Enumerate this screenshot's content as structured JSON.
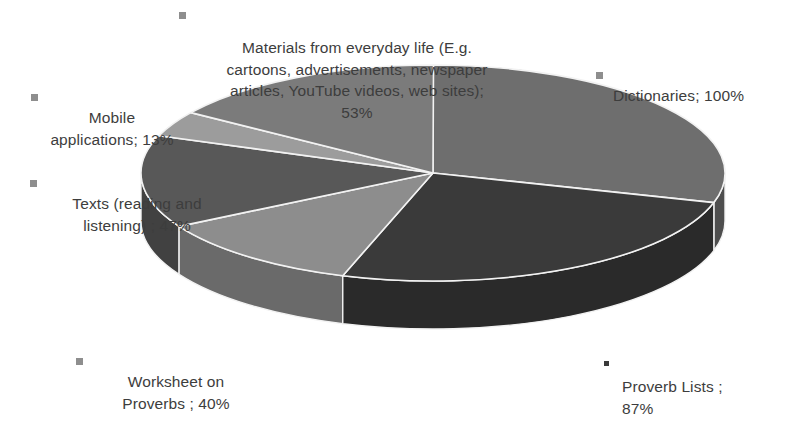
{
  "chart_data": {
    "type": "pie",
    "title": "",
    "subtitle": "",
    "xlabel": "",
    "ylabel": "",
    "style": "3d-exploded-pie",
    "legend": "data-labels-outside",
    "grid": false,
    "value_suffix": "%",
    "note": "Response percentages total 340% (multi-select survey); slice angles are proportional to each value's share of the total.",
    "categories": [
      "Dictionaries",
      "Proverb Lists ",
      "Worksheet on Proverbs ",
      "Texts (reading and listening) ",
      "Mobile applications",
      "Materials from everyday life (E.g. cartoons, advertisements, newspaper articles, YouTube videos, web sites)"
    ],
    "values": [
      100,
      87,
      40,
      47,
      13,
      53
    ],
    "colors": [
      "#6e6e6e",
      "#3a3a3a",
      "#8d8d8d",
      "#585858",
      "#9c9c9c",
      "#7b7b7b"
    ],
    "slices": [
      {
        "name": "Dictionaries",
        "value": 100,
        "value_text": "100%",
        "label_text": "Dictionaries; 100%",
        "color": "#6e6e6e",
        "side_color": "#4e4e4e",
        "start_deg": 0,
        "sweep_deg": 105.9,
        "marker": "square-gray"
      },
      {
        "name": "Proverb Lists ",
        "value": 87,
        "value_text": "87%",
        "label_text": "Proverb Lists ;\n87%",
        "color": "#3a3a3a",
        "side_color": "#2a2a2a",
        "start_deg": 105.9,
        "sweep_deg": 92.1,
        "marker": "square-boxed-dark"
      },
      {
        "name": "Worksheet on Proverbs ",
        "value": 40,
        "value_text": "40%",
        "label_text": "Worksheet on\nProverbs ; 40%",
        "color": "#8d8d8d",
        "side_color": "#6a6a6a",
        "start_deg": 198.0,
        "sweep_deg": 42.4,
        "marker": "square-gray"
      },
      {
        "name": "Texts (reading and listening) ",
        "value": 47,
        "value_text": "47%",
        "label_text": "Texts (reading and\nlistening) ; 47%",
        "color": "#585858",
        "side_color": "#414141",
        "start_deg": 240.4,
        "sweep_deg": 49.8,
        "marker": "square-gray"
      },
      {
        "name": "Mobile applications",
        "value": 13,
        "value_text": "13%",
        "label_text": "Mobile\napplications; 13%",
        "color": "#9c9c9c",
        "side_color": "#787878",
        "start_deg": 290.2,
        "sweep_deg": 13.8,
        "marker": "square-gray"
      },
      {
        "name": "Materials from everyday life (E.g. cartoons, advertisements, newspaper articles, YouTube videos, web sites)",
        "value": 53,
        "value_text": "53%",
        "label_text": "Materials from everyday life (E.g.\ncartoons, advertisements, newspaper\narticles, YouTube videos, web sites);\n53%",
        "color": "#7b7b7b",
        "side_color": "#5c5c5c",
        "start_deg": 304.0,
        "sweep_deg": 56.1,
        "marker": "square-gray"
      }
    ]
  },
  "labels": {
    "dictionaries": "Dictionaries; 100%",
    "proverb_lists": "Proverb Lists ;\n87%",
    "worksheet": "Worksheet on\nProverbs ; 40%",
    "texts": "Texts (reading and\nlistening) ; 47%",
    "mobile": "Mobile\napplications; 13%",
    "materials": "Materials from everyday life (E.g.\ncartoons, advertisements, newspaper\narticles, YouTube videos, web sites);\n53%"
  },
  "geometry": {
    "center_x": 433,
    "center_y": 173,
    "radius_x": 292,
    "radius_y": 108,
    "depth": 48,
    "separator_color": "#f2f2f2"
  }
}
